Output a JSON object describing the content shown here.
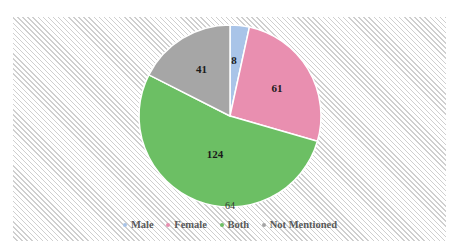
{
  "chart_data": {
    "type": "pie",
    "title": "",
    "categories": [
      "Male",
      "Female",
      "Both",
      "Not Mentioned"
    ],
    "values": [
      8,
      61,
      124,
      41
    ],
    "colors": [
      "#a9c4e8",
      "#e98fb0",
      "#6cbf64",
      "#a6a6a6"
    ],
    "data_labels": [
      "8",
      "61",
      "124",
      "41"
    ],
    "annotations": [
      "64"
    ],
    "legend_position": "bottom",
    "start_angle_deg": 0,
    "direction": "clockwise"
  },
  "legend": {
    "items": [
      {
        "label": "Male",
        "color": "#a9c4e8"
      },
      {
        "label": "Female",
        "color": "#e98fb0"
      },
      {
        "label": "Both",
        "color": "#6cbf64"
      },
      {
        "label": "Not Mentioned",
        "color": "#a6a6a6"
      }
    ]
  },
  "annotation_text": "64"
}
